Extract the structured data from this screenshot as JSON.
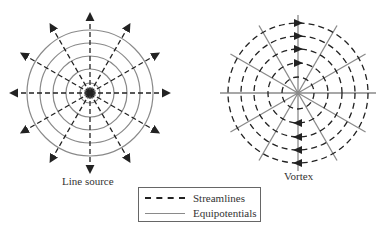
{
  "diagrams": [
    {
      "id": "line-source",
      "caption": "Line source",
      "center": [
        90,
        93
      ],
      "equipotential_radii": [
        10,
        24,
        37,
        50,
        63
      ],
      "streamline_count": 12,
      "streamline_length": 80,
      "arrow_direction": "outward"
    },
    {
      "id": "vortex",
      "caption": "Vortex",
      "center": [
        298,
        93
      ],
      "streamline_radii": [
        16,
        30,
        44,
        57,
        70
      ],
      "equipotential_count": 12,
      "equipotential_length": 78,
      "arrow_direction": "counterclockwise-visual: top points right, bottom points left"
    }
  ],
  "legend": {
    "items": [
      {
        "style": "dashed",
        "label": "Streamlines"
      },
      {
        "style": "solid",
        "label": "Equipotentials"
      }
    ]
  },
  "colors": {
    "streamline": "#222222",
    "equipotential": "#8a8a8a",
    "text": "#333333"
  }
}
